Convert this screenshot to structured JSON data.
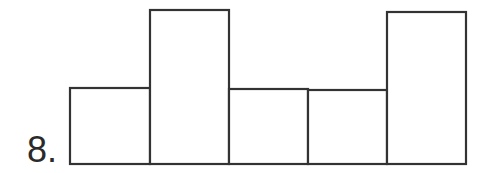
{
  "problem": {
    "number_label": "8."
  },
  "figure": {
    "stroke_color": "#333333",
    "fill_color": "#ffffff",
    "baseline_y": 164,
    "rectangles": [
      {
        "id": "rect-1",
        "x": 70,
        "width": 80,
        "top": 88
      },
      {
        "id": "rect-2",
        "x": 150,
        "width": 79,
        "top": 10
      },
      {
        "id": "rect-3",
        "x": 229,
        "width": 79,
        "top": 89
      },
      {
        "id": "rect-4",
        "x": 308,
        "width": 79,
        "top": 90
      },
      {
        "id": "rect-5",
        "x": 387,
        "width": 79,
        "top": 12
      }
    ]
  }
}
